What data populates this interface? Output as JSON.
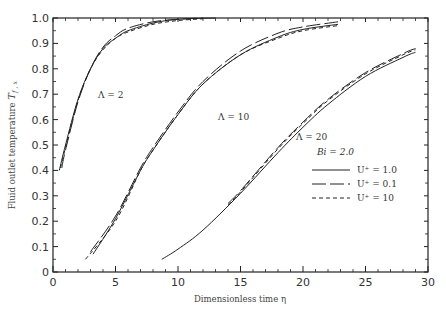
{
  "chart_data": {
    "type": "line",
    "title": "",
    "xlabel": "Dimensionless time η",
    "ylabel": "Fluid outlet temperature T_{f,x}",
    "xlim": [
      0,
      30
    ],
    "ylim": [
      0,
      1.0
    ],
    "x_ticks": [
      "0",
      "5",
      "10",
      "15",
      "20",
      "25",
      "30"
    ],
    "y_ticks": [
      "0",
      "0.1",
      "0.2",
      "0.3",
      "0.4",
      "0.5",
      "0.6",
      "0.7",
      "0.8",
      "0.9",
      "1.0"
    ],
    "grid": false,
    "legend_position": "inside-right",
    "legend_title": "Bi = 2.0",
    "legend": [
      {
        "label": "U⁺ = 1.0",
        "style": "solid"
      },
      {
        "label": "U⁺ = 0.1",
        "style": "long-dash"
      },
      {
        "label": "U⁺ = 10",
        "style": "short-dash"
      }
    ],
    "annotations": [
      {
        "text": "Λ = 2",
        "x": 3.6,
        "y": 0.69
      },
      {
        "text": "Λ = 10",
        "x": 13.2,
        "y": 0.6
      },
      {
        "text": "Λ = 20",
        "x": 19.5,
        "y": 0.53
      },
      {
        "text": "Bi = 2.0",
        "x": 20.3,
        "y": 0.38
      }
    ],
    "series": [
      {
        "name": "Λ = 2, U⁺ = 1.0",
        "style": "solid",
        "x": [
          0.5,
          1,
          2,
          3,
          4,
          5,
          6,
          8,
          10,
          13
        ],
        "y": [
          0.4,
          0.5,
          0.68,
          0.8,
          0.88,
          0.92,
          0.95,
          0.98,
          0.995,
          1.0
        ]
      },
      {
        "name": "Λ = 2, U⁺ = 0.1",
        "style": "long-dash",
        "x": [
          0.7,
          1,
          2,
          3,
          4,
          5,
          6,
          8,
          10,
          12
        ],
        "y": [
          0.41,
          0.48,
          0.67,
          0.8,
          0.885,
          0.93,
          0.96,
          0.985,
          0.995,
          1.0
        ]
      },
      {
        "name": "Λ = 2, U⁺ = 10",
        "style": "short-dash",
        "x": [
          0.6,
          1,
          2,
          3,
          4,
          5,
          6,
          8,
          10,
          12
        ],
        "y": [
          0.41,
          0.49,
          0.675,
          0.8,
          0.875,
          0.92,
          0.945,
          0.975,
          0.99,
          0.997
        ]
      },
      {
        "name": "Λ = 10, U⁺ = 1.0",
        "style": "solid",
        "x": [
          3.2,
          5,
          7,
          8,
          10,
          12,
          15,
          18,
          20,
          22.8
        ],
        "y": [
          0.07,
          0.21,
          0.4,
          0.48,
          0.62,
          0.74,
          0.855,
          0.925,
          0.955,
          0.975
        ]
      },
      {
        "name": "Λ = 10, U⁺ = 0.1",
        "style": "long-dash",
        "x": [
          3.0,
          5,
          7,
          8,
          10,
          12,
          15,
          18,
          20,
          22.8
        ],
        "y": [
          0.08,
          0.22,
          0.41,
          0.49,
          0.63,
          0.75,
          0.87,
          0.94,
          0.965,
          0.985
        ]
      },
      {
        "name": "Λ = 10, U⁺ = 10",
        "style": "short-dash",
        "x": [
          2.6,
          5,
          7,
          8,
          10,
          12,
          15,
          18,
          20,
          22.8
        ],
        "y": [
          0.05,
          0.2,
          0.4,
          0.48,
          0.62,
          0.74,
          0.855,
          0.92,
          0.95,
          0.97
        ]
      },
      {
        "name": "Λ = 20, U⁺ = 1.0",
        "style": "solid",
        "x": [
          8.7,
          10,
          12,
          15,
          18,
          20,
          22,
          25,
          28,
          29
        ],
        "y": [
          0.05,
          0.09,
          0.165,
          0.31,
          0.47,
          0.57,
          0.66,
          0.77,
          0.845,
          0.865
        ]
      },
      {
        "name": "Λ = 20, U⁺ = 0.1",
        "style": "long-dash",
        "x": [
          14,
          15,
          18,
          20,
          22,
          25,
          28,
          29
        ],
        "y": [
          0.27,
          0.32,
          0.49,
          0.59,
          0.68,
          0.785,
          0.86,
          0.88
        ]
      },
      {
        "name": "Λ = 20, U⁺ = 10",
        "style": "short-dash",
        "x": [
          14,
          15,
          18,
          20,
          22,
          25,
          28,
          29
        ],
        "y": [
          0.265,
          0.315,
          0.485,
          0.585,
          0.675,
          0.78,
          0.855,
          0.875
        ]
      }
    ]
  },
  "labels": {
    "xlabel": "Dimensionless time η",
    "ylabel_main": "Fluid outlet temperature ",
    "ylabel_sym": "T",
    "ylabel_sub": "f , x",
    "lambda2": "Λ = 2",
    "lambda10": "Λ = 10",
    "lambda20": "Λ = 20",
    "bi": "Bi = 2.0",
    "legend1": "U⁺ = 1.0",
    "legend2": "U⁺ = 0.1",
    "legend3": "U⁺ = 10"
  }
}
